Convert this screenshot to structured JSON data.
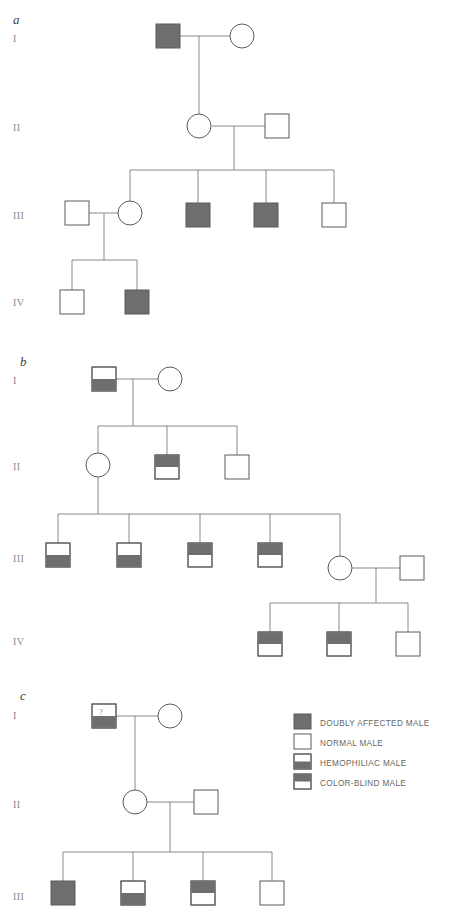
{
  "figure": {
    "title": "",
    "background": "#ffffff",
    "fill_color": "#6e6e6e",
    "empty_color": "#ffffff",
    "line_color": "#7d7d7d",
    "symbol_stroke": "#5a5a5a"
  },
  "panels": [
    {
      "letter": "a",
      "generations": [
        "I",
        "II",
        "III",
        "IV"
      ]
    },
    {
      "letter": "b",
      "generations": [
        "I",
        "II",
        "III",
        "IV"
      ]
    },
    {
      "letter": "c",
      "generations": [
        "I",
        "II",
        "III"
      ]
    }
  ],
  "legend": {
    "items": [
      {
        "label": "DOUBLY  AFFECTED MALE",
        "fill": "full"
      },
      {
        "label": "NORMAL MALE",
        "fill": "none"
      },
      {
        "label": "HEMOPHILIAC MALE",
        "fill": "bottom-half"
      },
      {
        "label": "COLOR-BLIND MALE",
        "fill": "top-half"
      }
    ]
  },
  "pedigree_a": {
    "individuals": [
      {
        "id": "a-I-1",
        "gen": "I",
        "sex": "male",
        "fill": "full"
      },
      {
        "id": "a-I-2",
        "gen": "I",
        "sex": "female",
        "fill": "none"
      },
      {
        "id": "a-II-1",
        "gen": "II",
        "sex": "female",
        "fill": "none"
      },
      {
        "id": "a-II-2",
        "gen": "II",
        "sex": "male",
        "fill": "none"
      },
      {
        "id": "a-III-1",
        "gen": "III",
        "sex": "male",
        "fill": "none"
      },
      {
        "id": "a-III-2",
        "gen": "III",
        "sex": "female",
        "fill": "none"
      },
      {
        "id": "a-III-3",
        "gen": "III",
        "sex": "male",
        "fill": "full"
      },
      {
        "id": "a-III-4",
        "gen": "III",
        "sex": "male",
        "fill": "full"
      },
      {
        "id": "a-III-5",
        "gen": "III",
        "sex": "male",
        "fill": "none"
      },
      {
        "id": "a-IV-1",
        "gen": "IV",
        "sex": "male",
        "fill": "none"
      },
      {
        "id": "a-IV-2",
        "gen": "IV",
        "sex": "male",
        "fill": "full"
      }
    ]
  },
  "pedigree_b": {
    "individuals": [
      {
        "id": "b-I-1",
        "gen": "I",
        "sex": "male",
        "fill": "bottom-half"
      },
      {
        "id": "b-I-2",
        "gen": "I",
        "sex": "female",
        "fill": "none"
      },
      {
        "id": "b-II-1",
        "gen": "II",
        "sex": "female",
        "fill": "none"
      },
      {
        "id": "b-II-2",
        "gen": "II",
        "sex": "male",
        "fill": "top-half"
      },
      {
        "id": "b-II-3",
        "gen": "II",
        "sex": "male",
        "fill": "none"
      },
      {
        "id": "b-III-1",
        "gen": "III",
        "sex": "male",
        "fill": "bottom-half"
      },
      {
        "id": "b-III-2",
        "gen": "III",
        "sex": "male",
        "fill": "bottom-half"
      },
      {
        "id": "b-III-3",
        "gen": "III",
        "sex": "male",
        "fill": "top-half"
      },
      {
        "id": "b-III-4",
        "gen": "III",
        "sex": "male",
        "fill": "top-half"
      },
      {
        "id": "b-III-5",
        "gen": "III",
        "sex": "female",
        "fill": "none"
      },
      {
        "id": "b-III-6",
        "gen": "III",
        "sex": "male",
        "fill": "none"
      },
      {
        "id": "b-IV-1",
        "gen": "IV",
        "sex": "male",
        "fill": "top-half"
      },
      {
        "id": "b-IV-2",
        "gen": "IV",
        "sex": "male",
        "fill": "top-half"
      },
      {
        "id": "b-IV-3",
        "gen": "IV",
        "sex": "male",
        "fill": "none"
      }
    ]
  },
  "pedigree_c": {
    "individuals": [
      {
        "id": "c-I-1",
        "gen": "I",
        "sex": "male",
        "fill": "bottom-half",
        "annotation": "?"
      },
      {
        "id": "c-I-2",
        "gen": "I",
        "sex": "female",
        "fill": "none"
      },
      {
        "id": "c-II-1",
        "gen": "II",
        "sex": "female",
        "fill": "none"
      },
      {
        "id": "c-II-2",
        "gen": "II",
        "sex": "male",
        "fill": "none"
      },
      {
        "id": "c-III-1",
        "gen": "III",
        "sex": "male",
        "fill": "full"
      },
      {
        "id": "c-III-2",
        "gen": "III",
        "sex": "male",
        "fill": "bottom-half"
      },
      {
        "id": "c-III-3",
        "gen": "III",
        "sex": "male",
        "fill": "top-half"
      },
      {
        "id": "c-III-4",
        "gen": "III",
        "sex": "male",
        "fill": "none"
      }
    ]
  }
}
